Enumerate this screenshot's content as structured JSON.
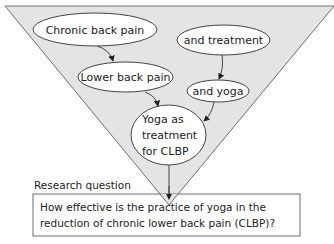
{
  "diagram": {
    "type": "funnel",
    "colors": {
      "funnel_fill": "#e4e4e4",
      "funnel_stroke": "#6e6e6e",
      "node_fill": "#ffffff",
      "node_stroke": "#444444",
      "text": "#222222"
    },
    "nodes": [
      {
        "id": "chronic",
        "label": "Chronic back pain"
      },
      {
        "id": "lower",
        "label": "Lower back pain"
      },
      {
        "id": "treatment",
        "label": "and treatment"
      },
      {
        "id": "yoga",
        "label": "and yoga"
      },
      {
        "id": "result",
        "lines": [
          "Yoga as",
          "treatment",
          "for CLBP"
        ]
      }
    ],
    "edges": [
      {
        "from": "chronic",
        "to": "lower"
      },
      {
        "from": "lower",
        "to": "result"
      },
      {
        "from": "treatment",
        "to": "yoga"
      },
      {
        "from": "yoga",
        "to": "result"
      },
      {
        "from": "result",
        "to": "question"
      }
    ],
    "research_question": {
      "label": "Research question",
      "lines": [
        "How effective is the practice of yoga in the",
        "reduction of chronic lower back pain (CLBP)?"
      ]
    }
  }
}
